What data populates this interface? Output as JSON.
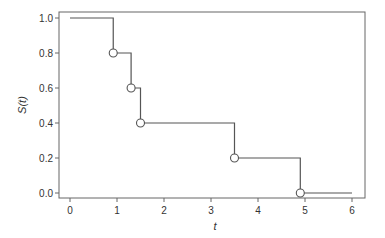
{
  "chart_data": {
    "type": "line",
    "subtype": "step (Kaplan-Meier survival curve)",
    "title": "",
    "xlabel": "t",
    "ylabel": "S(t)",
    "xlim": [
      -0.25,
      6.25
    ],
    "ylim": [
      -0.03,
      1.03
    ],
    "x_ticks": [
      0,
      1,
      2,
      3,
      4,
      5,
      6
    ],
    "x_tick_labels": [
      "0",
      "1",
      "2",
      "3",
      "4",
      "5",
      "6"
    ],
    "y_ticks": [
      0.0,
      0.2,
      0.4,
      0.6,
      0.8,
      1.0
    ],
    "y_tick_labels": [
      "0.0",
      "0.2",
      "0.4",
      "0.6",
      "0.8",
      "1.0"
    ],
    "grid": false,
    "legend": null,
    "series": [
      {
        "name": "S(t)",
        "step_times": [
          0,
          0.92,
          1.3,
          1.5,
          3.5,
          4.9,
          6.0
        ],
        "step_values": [
          1.0,
          0.8,
          0.6,
          0.4,
          0.2,
          0.0,
          0.0
        ],
        "event_markers": [
          {
            "t": 0.92,
            "s": 0.8
          },
          {
            "t": 1.3,
            "s": 0.6
          },
          {
            "t": 1.5,
            "s": 0.4
          },
          {
            "t": 3.5,
            "s": 0.2
          },
          {
            "t": 4.9,
            "s": 0.0
          }
        ],
        "color": "#555555",
        "marker": "open-circle"
      }
    ]
  },
  "colors": {
    "line": "#555555",
    "frame": "#666666",
    "text": "#333333",
    "background": "#ffffff"
  }
}
